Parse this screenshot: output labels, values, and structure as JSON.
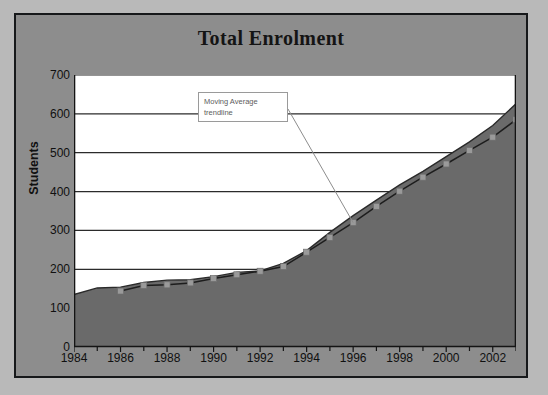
{
  "chart_data": {
    "type": "area",
    "title": "Total Enrolment",
    "xlabel": "",
    "ylabel": "Students",
    "ylim": [
      0,
      700
    ],
    "ytick_step": 100,
    "yticks": [
      "0",
      "100",
      "200",
      "300",
      "400",
      "500",
      "600",
      "700"
    ],
    "xlim": [
      1984,
      2003
    ],
    "xticks": [
      "1984",
      "1986",
      "1988",
      "1990",
      "1992",
      "1994",
      "1996",
      "1998",
      "2000",
      "2002"
    ],
    "xtick_step": 2,
    "minor_xticks": true,
    "grid": "horizontal",
    "legend": "none",
    "plot_background": "#ffffff",
    "area_fill_color": "#6a6a6a",
    "area_line_color": "#2a2a2a",
    "trendline_color": "#1d1d1d",
    "trendline_marker_color": "#9a9a9a",
    "series": [
      {
        "name": "Total Enrolment",
        "type": "area",
        "x": [
          1984,
          1985,
          1986,
          1987,
          1988,
          1989,
          1990,
          1991,
          1992,
          1993,
          1994,
          1995,
          1996,
          1997,
          1998,
          1999,
          2000,
          2001,
          2002,
          2003
        ],
        "values": [
          135,
          152,
          154,
          166,
          172,
          173,
          181,
          192,
          196,
          215,
          248,
          295,
          338,
          378,
          417,
          452,
          490,
          528,
          570,
          626
        ]
      },
      {
        "name": "Moving Average trendline",
        "type": "line",
        "x": [
          1986,
          1987,
          1988,
          1989,
          1990,
          1991,
          1992,
          1993,
          1994,
          1995,
          1996,
          1997,
          1998,
          1999,
          2000,
          2001,
          2002,
          2003
        ],
        "values": [
          144,
          158,
          160,
          165,
          176,
          186,
          195,
          207,
          244,
          282,
          320,
          362,
          401,
          437,
          471,
          506,
          540,
          585
        ]
      }
    ],
    "annotations": [
      {
        "name": "moving-average-callout",
        "lines": [
          "Moving Average",
          "trendline"
        ],
        "points_to_x": 1996,
        "points_to_y": 320
      }
    ]
  },
  "page": {
    "background_color": "#b9b9b9",
    "frame_color": "#16181a",
    "chart_background_color": "#8d8d8d"
  }
}
